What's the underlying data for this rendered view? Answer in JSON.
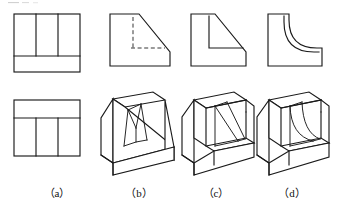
{
  "sheet": {
    "width": 340,
    "height": 210,
    "background_color": "#ffffff",
    "line_color": "#1a1a1a",
    "hidden_line_color": "#2a2a2a",
    "drawing_type": "orthographic-multiview-and-isometric-exercise",
    "description": "Engineering drawing exercise: two orthographic views in column (a) with three candidate isometric solids (b), (c), (d), each topped by its profile view."
  },
  "captions": [
    {
      "key": "a",
      "label": "（a）",
      "x": 57,
      "y": 197
    },
    {
      "key": "b",
      "label": "（b）",
      "x": 139,
      "y": 197
    },
    {
      "key": "c",
      "label": "（c）",
      "x": 216,
      "y": 197
    },
    {
      "key": "d",
      "label": "（d）",
      "x": 292,
      "y": 197
    }
  ],
  "columns": [
    {
      "key": "a",
      "label": "（a）",
      "kind": "orthographic-views",
      "views": [
        {
          "name": "top-view",
          "position": "upper",
          "shape": "rectangle-with-internal-divisions",
          "outline": {
            "x": 14,
            "y": 14,
            "width": 66,
            "height": 58
          },
          "internal_lines": [
            {
              "type": "vertical",
              "x": 36,
              "y1": 14,
              "y2": 56
            },
            {
              "type": "vertical",
              "x": 58,
              "y1": 14,
              "y2": 56
            },
            {
              "type": "horizontal",
              "y": 56,
              "x1": 14,
              "x2": 80
            }
          ]
        },
        {
          "name": "front-view",
          "position": "lower",
          "shape": "rectangle-with-internal-divisions",
          "outline": {
            "x": 14,
            "y": 100,
            "width": 66,
            "height": 56
          },
          "internal_lines": [
            {
              "type": "horizontal",
              "y": 118,
              "x1": 14,
              "x2": 80
            },
            {
              "type": "vertical",
              "x": 36,
              "y1": 118,
              "y2": 156
            },
            {
              "type": "vertical",
              "x": 58,
              "y1": 118,
              "y2": 156
            }
          ]
        }
      ]
    },
    {
      "key": "b",
      "label": "（b）",
      "kind": "candidate-solid",
      "profile_view": {
        "name": "side-view-b",
        "shape": "chamfered-L-with-hidden-lines",
        "visible_outline": "left wall, bottom edge, short right vertical, diagonal from top-left to lower-right",
        "hidden_lines": [
          {
            "type": "vertical",
            "description": "inner vertical hidden edge"
          },
          {
            "type": "horizontal",
            "description": "inner horizontal hidden edge"
          }
        ]
      },
      "isometric": {
        "name": "solid-b",
        "description": "Wedge block with full-width inclined surface and a central trapezoidal rib standing on the slope"
      }
    },
    {
      "key": "c",
      "label": "（c）",
      "kind": "candidate-solid",
      "profile_view": {
        "name": "side-view-c",
        "shape": "chamfered-L-with-visible-lines",
        "visible_outline": "left wall, bottom edge, short right vertical, diagonal from top-left to lower-right",
        "hidden_lines": []
      },
      "isometric": {
        "name": "solid-c",
        "description": "L-shaped block with a straight triangular gusset rib between the vertical wall and the base"
      }
    },
    {
      "key": "d",
      "label": "（d）",
      "kind": "candidate-solid",
      "profile_view": {
        "name": "side-view-d",
        "shape": "concave-filleted-L",
        "visible_outline": "left wall, bottom edge, short right vertical, concave quarter-round curve from top of wall to base",
        "hidden_lines": []
      },
      "isometric": {
        "name": "solid-d",
        "description": "L-shaped block with a concave curved (filleted) gusset rib between the vertical wall and the base"
      }
    }
  ]
}
